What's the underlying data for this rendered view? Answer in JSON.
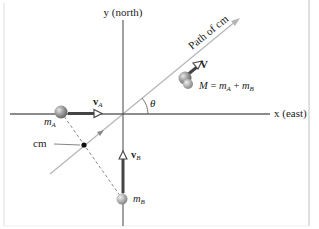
{
  "diagram": {
    "header_cut_text": "",
    "axes": {
      "x_label": "x (east)",
      "y_label": "y (north)"
    },
    "path_label": "Path of cm",
    "angle_label": "θ",
    "combined": {
      "velocity_label": "V",
      "mass_label_M": "M",
      "mass_label_eq": " = ",
      "mass_label_mA": "m",
      "mass_label_mA_sub": "A",
      "mass_label_plus": " + ",
      "mass_label_mB": "m",
      "mass_label_mB_sub": "B"
    },
    "particle_A": {
      "mass_label": "m",
      "mass_sub": "A",
      "velocity_label": "v",
      "velocity_sub": "A"
    },
    "particle_B": {
      "mass_label": "m",
      "mass_sub": "B",
      "velocity_label": "v",
      "velocity_sub": "B"
    },
    "cm_label": "cm",
    "colors": {
      "axis": "#555555",
      "path_line": "#b8b8b8",
      "velocity_arrow": "#444444",
      "ball": "#9a9a9a",
      "ball_highlight": "#dcdcdc",
      "frame": "#cccccc"
    }
  }
}
